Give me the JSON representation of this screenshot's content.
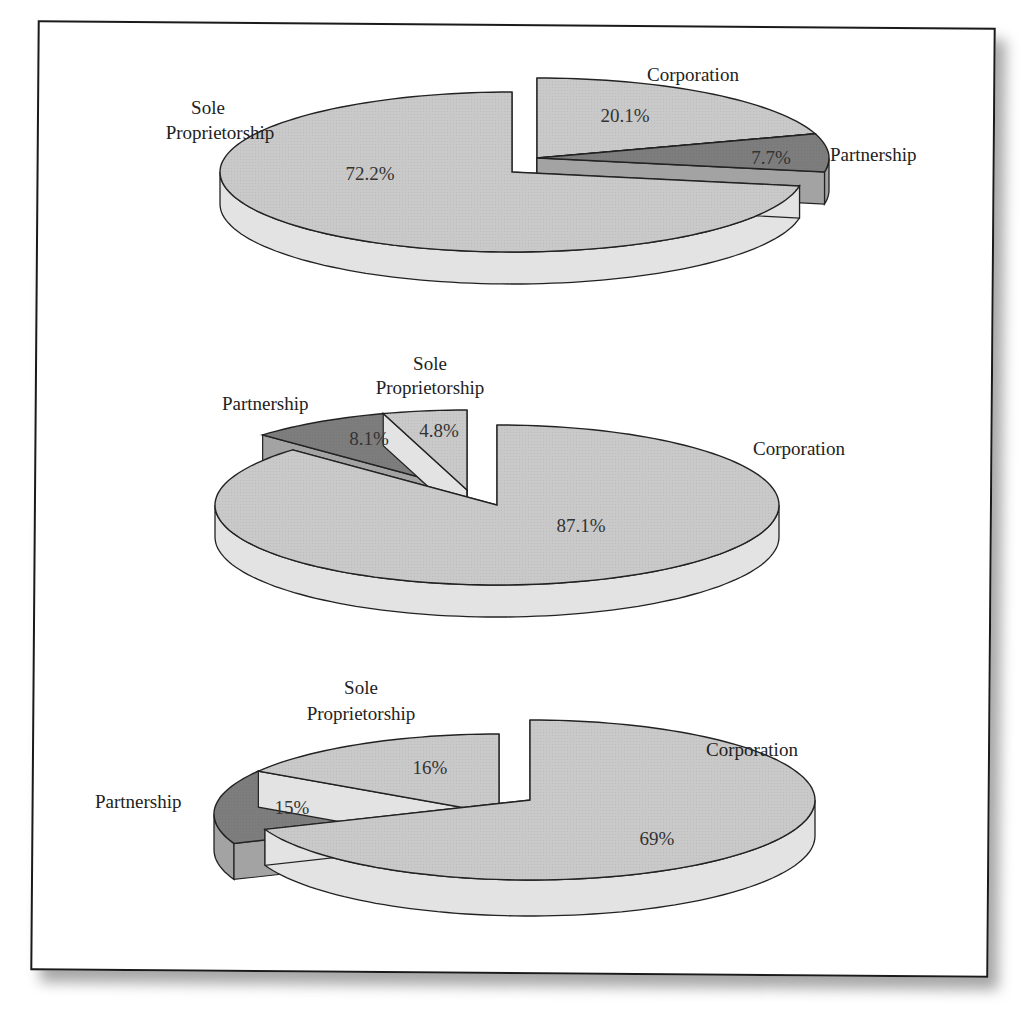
{
  "chart_data": [
    {
      "type": "pie",
      "style": "3d-exploded",
      "title": "",
      "categories": [
        "Sole Proprietorship",
        "Partnership",
        "Corporation"
      ],
      "values": [
        72.2,
        7.7,
        20.1
      ],
      "value_labels": [
        "72.2%",
        "7.7%",
        "20.1%"
      ],
      "exploded": [
        "Corporation",
        "Partnership"
      ]
    },
    {
      "type": "pie",
      "style": "3d-exploded",
      "title": "",
      "categories": [
        "Sole Proprietorship",
        "Partnership",
        "Corporation"
      ],
      "values": [
        4.8,
        8.1,
        87.1
      ],
      "value_labels": [
        "4.8%",
        "8.1%",
        "87.1%"
      ],
      "exploded": [
        "Sole Proprietorship",
        "Partnership"
      ]
    },
    {
      "type": "pie",
      "style": "3d-exploded",
      "title": "",
      "categories": [
        "Sole Proprietorship",
        "Partnership",
        "Corporation"
      ],
      "values": [
        16,
        15,
        69
      ],
      "value_labels": [
        "16%",
        "15%",
        "69%"
      ],
      "exploded": [
        "Sole Proprietorship",
        "Partnership"
      ]
    }
  ],
  "colors": {
    "light_slice_top": "#c9c9c9",
    "light_slice_side": "#e3e3e3",
    "dark_slice_top": "#7d7d7d",
    "dark_slice_side": "#a3a3a3",
    "outline": "#222222"
  },
  "labels": {
    "chart1": {
      "sole_line1": "Sole",
      "sole_line2": "Proprietorship",
      "corporation": "Corporation",
      "partnership": "Partnership",
      "sole_pct": "72.2%",
      "corp_pct": "20.1%",
      "part_pct": "7.7%"
    },
    "chart2": {
      "sole_line1": "Sole",
      "sole_line2": "Proprietorship",
      "corporation": "Corporation",
      "partnership": "Partnership",
      "sole_pct": "4.8%",
      "corp_pct": "87.1%",
      "part_pct": "8.1%"
    },
    "chart3": {
      "sole_line1": "Sole",
      "sole_line2": "Proprietorship",
      "corporation": "Corporation",
      "partnership": "Partnership",
      "sole_pct": "16%",
      "corp_pct": "69%",
      "part_pct": "15%"
    }
  }
}
